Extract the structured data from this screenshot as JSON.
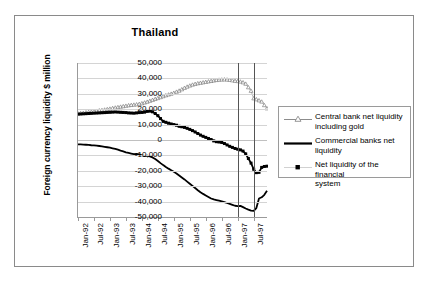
{
  "chart_data": {
    "type": "line",
    "title": "Thailand",
    "xlabel": "",
    "ylabel": "Foreign currency liquidity $ million",
    "ylim": [
      -50000,
      50000
    ],
    "ytick_labels": [
      "50,000",
      "40,000",
      "30,000",
      "20,000",
      "10,000",
      "0",
      "-10,000",
      "-20,000",
      "-30,000",
      "-40,000",
      "-50,000"
    ],
    "ytick_values": [
      50000,
      40000,
      30000,
      20000,
      10000,
      0,
      -10000,
      -20000,
      -30000,
      -40000,
      -50000
    ],
    "xtick_labels": [
      "Jan-92",
      "Jul-92",
      "Jan-93",
      "Jul-93",
      "Jan-94",
      "Jul-94",
      "Jan-95",
      "Jul-95",
      "Jan-96",
      "Jul-96",
      "Jan-97",
      "Jul-97"
    ],
    "grid": true,
    "legend_position": "right",
    "annotations": [
      {
        "name": "reference-line-jan-97",
        "x_label": "Jan-97",
        "x_index": 60
      },
      {
        "name": "reference-line-jul-97",
        "x_label": "Jul-97",
        "x_index": 66
      }
    ],
    "x_start": "Jan-92",
    "x_end": "Dec-97",
    "x_step_months": 1,
    "series": [
      {
        "name": "Central bank net liquidity including gold",
        "marker": "open-triangle",
        "line": "thin",
        "color": "#555555",
        "values": [
          17200,
          17400,
          17600,
          17900,
          18100,
          18300,
          18600,
          18900,
          19200,
          19400,
          19700,
          20000,
          20300,
          20700,
          21000,
          21300,
          21600,
          21900,
          22200,
          22500,
          22700,
          22900,
          23100,
          23400,
          23800,
          24300,
          24800,
          25400,
          26000,
          26600,
          27200,
          27800,
          28400,
          29000,
          29500,
          30000,
          30600,
          31300,
          32000,
          32900,
          33800,
          34600,
          35300,
          35900,
          36400,
          36800,
          37100,
          37400,
          37700,
          38000,
          38300,
          38600,
          38900,
          39100,
          39200,
          39300,
          39200,
          39000,
          38700,
          38400,
          38200,
          37900,
          37400,
          36500,
          34200,
          31900,
          27000,
          26400,
          25700,
          24900,
          22600,
          20500
        ]
      },
      {
        "name": "Commercial banks net liquidity",
        "marker": "none",
        "line": "thick",
        "color": "#000000",
        "values": [
          -2800,
          -2900,
          -3000,
          -3100,
          -3200,
          -3400,
          -3500,
          -3700,
          -3900,
          -4100,
          -4400,
          -4700,
          -5000,
          -5400,
          -5800,
          -6300,
          -6900,
          -7400,
          -8000,
          -8400,
          -8800,
          -9200,
          -9000,
          -9400,
          -9900,
          -10400,
          -10200,
          -10600,
          -11300,
          -12400,
          -13600,
          -15000,
          -16300,
          -17500,
          -18600,
          -19600,
          -20600,
          -21700,
          -23000,
          -24300,
          -25600,
          -27000,
          -28400,
          -29800,
          -31200,
          -32600,
          -33900,
          -35000,
          -36000,
          -37000,
          -38000,
          -38600,
          -39000,
          -39400,
          -39800,
          -40300,
          -40900,
          -41500,
          -42100,
          -42700,
          -43000,
          -42800,
          -43600,
          -44500,
          -45200,
          -45800,
          -46000,
          -44200,
          -38000,
          -37200,
          -35600,
          -33000
        ]
      },
      {
        "name": "Net liquidity of the financial system",
        "marker": "filled-square",
        "line": "thick",
        "color": "#000000",
        "values": [
          16800,
          16900,
          17000,
          17100,
          17200,
          17300,
          17400,
          17500,
          17600,
          17700,
          17800,
          17900,
          18000,
          18100,
          18200,
          18100,
          18000,
          17900,
          17800,
          17600,
          17500,
          17400,
          17600,
          17800,
          17900,
          18100,
          18600,
          18800,
          18300,
          17200,
          15800,
          13900,
          12100,
          11500,
          10900,
          10400,
          10000,
          9600,
          8900,
          8600,
          8200,
          7600,
          6900,
          6100,
          5200,
          4200,
          3200,
          2400,
          1700,
          1000,
          300,
          -600,
          -1100,
          -1300,
          -1600,
          -2300,
          -3200,
          -4100,
          -4800,
          -5500,
          -6000,
          -6400,
          -7200,
          -9000,
          -12000,
          -15000,
          -19000,
          -21200,
          -21000,
          -17800,
          -17200,
          -17000
        ]
      }
    ]
  },
  "legend": {
    "items": [
      {
        "label_line1": "Central bank net liquidity",
        "label_line2": "including gold",
        "key": "triangle-line-key"
      },
      {
        "label_line1": "Commercial banks net",
        "label_line2": "liquidity",
        "key": "thick-line-key"
      },
      {
        "label_line1": "Net liquidity of the financial",
        "label_line2": "system",
        "key": "square-key"
      }
    ]
  },
  "colors": {
    "axis": "#9a9a9a",
    "grid": "#d4d4d4",
    "border": "#8a8a8a",
    "reference_line": "#555555",
    "series_dark": "#000000",
    "series_light": "#555555"
  }
}
